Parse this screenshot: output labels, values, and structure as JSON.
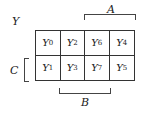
{
  "diagram": {
    "type": "karnaugh-map",
    "output_label": "Y",
    "labels": {
      "A": "A",
      "B": "B",
      "C": "C"
    },
    "rows": [
      [
        {
          "var": "Y",
          "sub": "0"
        },
        {
          "var": "Y",
          "sub": "2"
        },
        {
          "var": "Y",
          "sub": "6"
        },
        {
          "var": "Y",
          "sub": "4"
        }
      ],
      [
        {
          "var": "Y",
          "sub": "1"
        },
        {
          "var": "Y",
          "sub": "3"
        },
        {
          "var": "Y",
          "sub": "7"
        },
        {
          "var": "Y",
          "sub": "5"
        }
      ]
    ]
  }
}
